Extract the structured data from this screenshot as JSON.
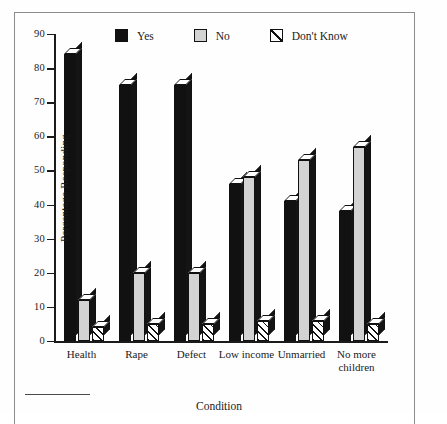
{
  "figure": {
    "background_color": "#ffffff",
    "ink_color": "#111111"
  },
  "legend": {
    "position": "top",
    "items": [
      {
        "label": "Yes",
        "swatch": "filled-black-square-icon",
        "color": "#111111"
      },
      {
        "label": "No",
        "swatch": "filled-gray-square-icon",
        "color": "#d3d3d3"
      },
      {
        "label": "Don't Know",
        "swatch": "hatched-square-icon",
        "color": "#ffffff"
      }
    ]
  },
  "axes": {
    "y": {
      "title": "Percentage Responding",
      "ticks": [
        0,
        10,
        20,
        30,
        40,
        50,
        60,
        70,
        80,
        90
      ],
      "min": 0,
      "max": 90
    },
    "x": {
      "title": "Condition"
    }
  },
  "chart_data": {
    "type": "bar",
    "title": "",
    "xlabel": "Condition",
    "ylabel": "Percentage Responding",
    "ylim": [
      0,
      90
    ],
    "grid": false,
    "legend_position": "top",
    "categories": [
      "Health",
      "Rape",
      "Defect",
      "Low income",
      "Unmarried",
      "No more children"
    ],
    "series": [
      {
        "name": "Yes",
        "color": "#111111",
        "values": [
          84,
          75,
          75,
          46,
          41,
          38
        ]
      },
      {
        "name": "No",
        "color": "#d3d3d3",
        "values": [
          12,
          20,
          20,
          48,
          53,
          57
        ]
      },
      {
        "name": "Don't Know",
        "color": "#ffffff",
        "values": [
          4,
          5,
          5,
          6,
          6,
          5
        ]
      }
    ]
  }
}
